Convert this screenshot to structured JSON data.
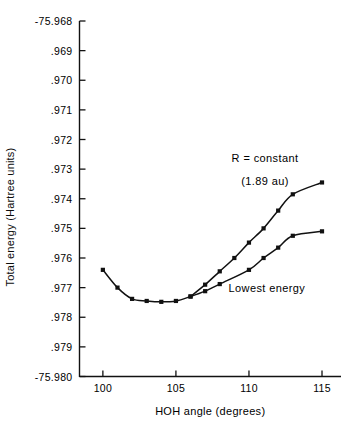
{
  "chart_data": {
    "type": "line",
    "title": "",
    "xlabel": "HOH  angle (degrees)",
    "ylabel": "Total energy (Hartree units)",
    "xlim": [
      98.4,
      116.3
    ],
    "ylim": [
      -75.98,
      -75.968
    ],
    "grid": false,
    "legend_position": "inline-annotation",
    "xticks": [
      100,
      105,
      110,
      115
    ],
    "xticklabels": [
      "100",
      "105",
      "110",
      "115"
    ],
    "yticks": [
      -75.968,
      -75.969,
      -75.97,
      -75.971,
      -75.972,
      -75.973,
      -75.974,
      -75.975,
      -75.976,
      -75.977,
      -75.978,
      -75.979,
      -75.98
    ],
    "yticklabels": [
      "-75.968",
      ".969",
      ".970",
      ".971",
      ".972",
      ".973",
      ".974",
      ".975",
      ".976",
      ".977",
      ".978",
      ".979",
      "-75.980"
    ],
    "series": [
      {
        "name": "Lowest energy",
        "marker": "square",
        "x": [
          100,
          101,
          102,
          103,
          104,
          105,
          106,
          107,
          108,
          110,
          111,
          112,
          113,
          115
        ],
        "y": [
          -75.9764,
          -75.977,
          -75.97738,
          -75.97745,
          -75.97748,
          -75.97745,
          -75.9773,
          -75.97712,
          -75.97688,
          -75.9764,
          -75.976,
          -75.97565,
          -75.97525,
          -75.9751
        ]
      },
      {
        "name": "R = constant",
        "marker": "square",
        "x": [
          106,
          107,
          108,
          109,
          110,
          111,
          112,
          113,
          115
        ],
        "y": [
          -75.9773,
          -75.9769,
          -75.97645,
          -75.976,
          -75.97548,
          -75.975,
          -75.9744,
          -75.97385,
          -75.97345
        ]
      }
    ],
    "annotations": [
      {
        "name": "r-constant-label",
        "line1": "R = constant",
        "line2": "(1.89 au)"
      },
      {
        "name": "lowest-energy-label",
        "text": "Lowest  energy"
      }
    ]
  },
  "figure": {
    "axis_color": "#111111",
    "curve_color": "#111111",
    "marker_color": "#111111",
    "background": "#ffffff"
  }
}
